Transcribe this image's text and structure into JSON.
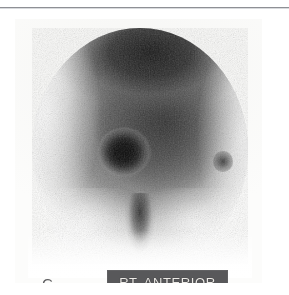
{
  "figure": {
    "panel_letter": "C",
    "modality_caption": "RT. ANTERIOR"
  },
  "annotation_bar": {
    "text": "RT. ANTERIOR",
    "background_color": "#58585a",
    "text_color": "#eceae6"
  },
  "panel": {
    "label": "C",
    "label_color": "#5e5e60",
    "film_background": "#fbfbfa"
  },
  "rule": {
    "color": "#8e9095"
  },
  "scan": {
    "view_name": "RT. ANTERIOR",
    "image_type": "planar-scintigraphy",
    "regions": [
      {
        "name": "vertex-uptake",
        "intensity": "intense"
      },
      {
        "name": "diffuse-cranial-uptake",
        "intensity": "moderate"
      },
      {
        "name": "focal-lesion",
        "intensity": "very-intense"
      },
      {
        "name": "secondary-focus-right",
        "intensity": "mild"
      },
      {
        "name": "nasal-midline-uptake",
        "intensity": "moderate"
      },
      {
        "name": "inferior-orbital-cold",
        "intensity": "low"
      },
      {
        "name": "left-lateral-cold",
        "intensity": "low"
      }
    ]
  }
}
